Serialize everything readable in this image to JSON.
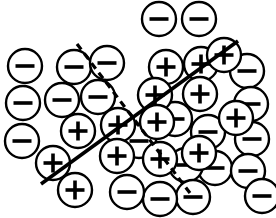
{
  "figure": {
    "width": 276,
    "height": 218,
    "background_color": "#ffffff",
    "ink_color": "#000000"
  },
  "legend_symbols": {
    "positive_label": "+",
    "negative_label": "−",
    "positive_name": "plus-marker",
    "negative_name": "minus-marker"
  },
  "style": {
    "circle_radius": 17,
    "circle_stroke_width": 2.4,
    "glyph_stroke_width": 3.6,
    "glyph_arm": 9.5,
    "solid_line_width": 3.6,
    "dashed_line_width": 3.2,
    "dash_pattern": "7 5"
  },
  "boundaries": [
    {
      "name": "solid-decision-boundary",
      "style": "solid",
      "color": "#000000",
      "x1": 41,
      "y1": 184,
      "x2": 238,
      "y2": 41
    },
    {
      "name": "dashed-decision-boundary",
      "style": "dashed",
      "color": "#000000",
      "x1": 77,
      "y1": 44,
      "x2": 193,
      "y2": 197
    }
  ],
  "chart_data": {
    "type": "scatter",
    "xlabel": "",
    "ylabel": "",
    "xlim": [
      0,
      276
    ],
    "ylim": [
      0,
      218
    ],
    "grid": false,
    "legend_position": "none",
    "classes": [
      "+",
      "−"
    ],
    "counts": {
      "plus": 14,
      "minus": 22,
      "total": 36
    },
    "series": [
      {
        "name": "negative",
        "label": "−",
        "marker": "circle-minus",
        "points": [
          {
            "x": 159,
            "y": 19
          },
          {
            "x": 199,
            "y": 19
          },
          {
            "x": 25,
            "y": 66
          },
          {
            "x": 74,
            "y": 67
          },
          {
            "x": 107,
            "y": 63
          },
          {
            "x": 23,
            "y": 103
          },
          {
            "x": 62,
            "y": 100
          },
          {
            "x": 98,
            "y": 97
          },
          {
            "x": 247,
            "y": 71
          },
          {
            "x": 251,
            "y": 104
          },
          {
            "x": 22,
            "y": 141
          },
          {
            "x": 139,
            "y": 141
          },
          {
            "x": 175,
            "y": 119
          },
          {
            "x": 208,
            "y": 132
          },
          {
            "x": 252,
            "y": 139
          },
          {
            "x": 215,
            "y": 168
          },
          {
            "x": 186,
            "y": 165
          },
          {
            "x": 248,
            "y": 171
          },
          {
            "x": 193,
            "y": 197
          },
          {
            "x": 160,
            "y": 199
          },
          {
            "x": 127,
            "y": 192
          },
          {
            "x": 262,
            "y": 196
          }
        ]
      },
      {
        "name": "positive",
        "label": "+",
        "marker": "circle-plus",
        "points": [
          {
            "x": 166,
            "y": 67
          },
          {
            "x": 201,
            "y": 64
          },
          {
            "x": 224,
            "y": 55
          },
          {
            "x": 155,
            "y": 95
          },
          {
            "x": 200,
            "y": 94
          },
          {
            "x": 78,
            "y": 131
          },
          {
            "x": 118,
            "y": 125
          },
          {
            "x": 157,
            "y": 122
          },
          {
            "x": 236,
            "y": 118
          },
          {
            "x": 53,
            "y": 163
          },
          {
            "x": 117,
            "y": 156
          },
          {
            "x": 160,
            "y": 159
          },
          {
            "x": 199,
            "y": 153
          },
          {
            "x": 75,
            "y": 190
          }
        ]
      }
    ]
  }
}
